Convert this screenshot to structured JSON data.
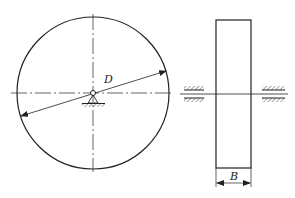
{
  "diagram": {
    "front_view": {
      "label_diameter": "D",
      "shape": "circle",
      "support": "pin-support"
    },
    "side_view": {
      "label_width": "B",
      "shape": "rectangle",
      "bearings": 2
    },
    "colors": {
      "line": "#222222",
      "background": "#ffffff"
    }
  }
}
